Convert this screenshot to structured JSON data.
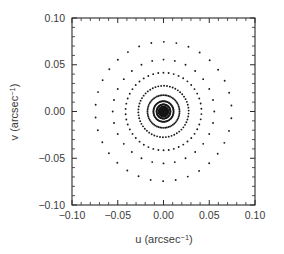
{
  "chart_data": {
    "type": "scatter",
    "title": "",
    "xlabel": "u (arcsec-1)",
    "ylabel": "v (arcsec-1)",
    "xlabel_base": "u (arcsec",
    "xlabel_sup": "-1",
    "xlabel_tail": ")",
    "ylabel_base": "v (arcsec",
    "ylabel_sup": "-1",
    "ylabel_tail": ")",
    "xlim": [
      -0.1,
      0.1
    ],
    "ylim": [
      -0.1,
      0.1
    ],
    "xticks": [
      -0.1,
      -0.05,
      0.0,
      0.05,
      0.1
    ],
    "yticks": [
      -0.1,
      -0.05,
      0.0,
      0.05,
      0.1
    ],
    "xtick_labels": [
      "-0.10",
      "-0.05",
      "0.00",
      "0.05",
      "0.10"
    ],
    "ytick_labels": [
      "-0.10",
      "-0.05",
      "0.00",
      "0.05",
      "0.10"
    ],
    "minor_ticks_per_interval": 4,
    "grid": false,
    "legend": null,
    "tick_direction": "in",
    "marker": "dot",
    "marker_size_px": 1.4,
    "marker_color": "#1a1a1a",
    "rings": [
      {
        "radius": 0.0745,
        "count": 34,
        "phase_deg": 5
      },
      {
        "radius": 0.0555,
        "count": 28,
        "phase_deg": 0
      },
      {
        "radius": 0.0415,
        "count": 46,
        "phase_deg": 4
      },
      {
        "radius": 0.0275,
        "count": 54,
        "phase_deg": 2
      },
      {
        "radius": 0.0175,
        "count": 60,
        "phase_deg": 0
      },
      {
        "radius": 0.011,
        "count": 72,
        "phase_deg": 3
      },
      {
        "radius": 0.0075,
        "count": 80,
        "phase_deg": 0
      },
      {
        "radius": 0.005,
        "count": 90,
        "phase_deg": 0
      },
      {
        "radius": 0.003,
        "count": 96,
        "phase_deg": 0
      },
      {
        "radius": 0.0014,
        "count": 60,
        "phase_deg": 0
      }
    ]
  },
  "figure": {
    "background": "#ffffff",
    "axis_color": "#2b2b2b",
    "text_color": "#3a3a3a"
  }
}
